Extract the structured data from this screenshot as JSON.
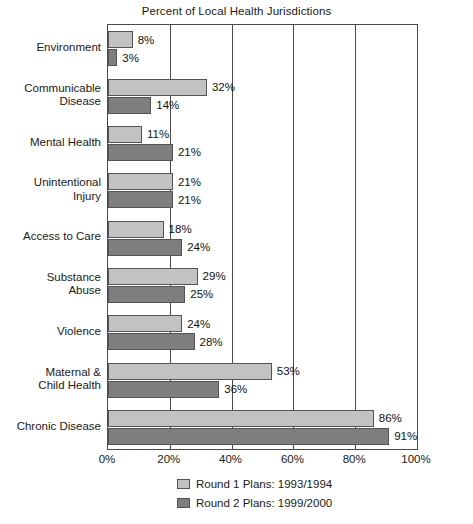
{
  "chart_data": {
    "type": "bar",
    "orientation": "horizontal",
    "title": "Percent of Local Health Jurisdictions",
    "xlabel": "",
    "ylabel": "",
    "xlim": [
      0,
      100
    ],
    "grid": true,
    "legend_position": "bottom",
    "categories": [
      "Environment",
      "Communicable Disease",
      "Mental Health",
      "Unintentional Injury",
      "Access to Care",
      "Substance Abuse",
      "Violence",
      "Maternal & Child Health",
      "Chronic Disease"
    ],
    "category_lines": [
      [
        "Environment"
      ],
      [
        "Communicable",
        "Disease"
      ],
      [
        "Mental Health"
      ],
      [
        "Unintentional",
        "Injury"
      ],
      [
        "Access to Care"
      ],
      [
        "Substance",
        "Abuse"
      ],
      [
        "Violence"
      ],
      [
        "Maternal &",
        "Child Health"
      ],
      [
        "Chronic Disease"
      ]
    ],
    "series": [
      {
        "name": "Round 1 Plans: 1993/1994",
        "color": "#c2c2c2",
        "values": [
          8,
          32,
          11,
          21,
          18,
          29,
          24,
          53,
          86
        ],
        "value_labels": [
          "8%",
          "32%",
          "11%",
          "21%",
          "18%",
          "29%",
          "24%",
          "53%",
          "86%"
        ]
      },
      {
        "name": "Round 2 Plans: 1999/2000",
        "color": "#7e7e7e",
        "values": [
          3,
          14,
          21,
          21,
          24,
          25,
          28,
          36,
          91
        ],
        "value_labels": [
          "3%",
          "14%",
          "21%",
          "21%",
          "24%",
          "25%",
          "28%",
          "36%",
          "91%"
        ]
      }
    ],
    "xticks": [
      0,
      20,
      40,
      60,
      80,
      100
    ],
    "xtick_labels": [
      "0%",
      "20%",
      "40%",
      "60%",
      "80%",
      "100%"
    ]
  },
  "legend": {
    "items": [
      {
        "label": "Round 1 Plans: 1993/1994",
        "swatch": "light-gray-swatch"
      },
      {
        "label": "Round 2 Plans: 1999/2000",
        "swatch": "dark-gray-swatch"
      }
    ]
  }
}
